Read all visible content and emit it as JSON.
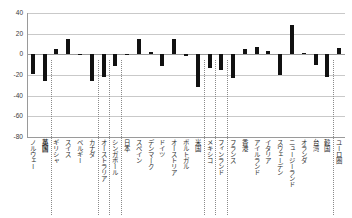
{
  "chart_data": {
    "type": "bar",
    "title": "",
    "subtitle": "",
    "xlabel": "",
    "ylabel": "",
    "ylim": [
      -80,
      40
    ],
    "yticks": [
      40,
      20,
      0,
      -20,
      -40,
      -60,
      -80
    ],
    "grid": true,
    "legend": false,
    "legend_position": "none",
    "orientation": "vertical",
    "bar_color": "#111111",
    "zero_line": 0,
    "categories": [
      "ノルウェー",
      "英国",
      "ギリシャ",
      "スイス",
      "ベルギー",
      "カナダ",
      "オーストラリア",
      "シンガポール",
      "日本",
      "スペイン",
      "デンマーク",
      "ドイツ",
      "オーストリア",
      "ポルトガル",
      "米国",
      "メキシコ",
      "フィンランド",
      "フランス",
      "香港",
      "アイルランド",
      "イタリア",
      "スウェーデン",
      "ニュージーランド",
      "オランダ",
      "台湾",
      "韓国",
      "ユーロ圏"
    ],
    "values": [
      -19,
      -26,
      5,
      15,
      -1,
      -26,
      -22,
      -11,
      0,
      15,
      2,
      -11,
      15,
      -2,
      -32,
      -13,
      -15,
      -23,
      5,
      7,
      3,
      -20,
      28,
      1,
      -10,
      -22,
      6
    ],
    "group_separators_after": [
      "英国",
      "カナダ",
      "オーストラリア",
      "シンガポール",
      "米国",
      "メキシコ",
      "フィンランド",
      "韓国"
    ],
    "highlighted_category": "英国"
  },
  "axis": {
    "y_tick_labels": [
      "40",
      "20",
      "0",
      "-20",
      "-40",
      "-60",
      "-80"
    ]
  }
}
